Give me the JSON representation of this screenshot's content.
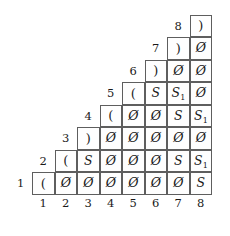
{
  "figure": {
    "kind": "cyk-parse-table",
    "rows": 8,
    "columns": 8,
    "border_color": "#5e5e5e",
    "text_color": "#1a1a1a",
    "background_color": "#ffffff"
  },
  "axes": {
    "row_labels": [
      "1",
      "2",
      "3",
      "4",
      "5",
      "6",
      "7",
      "8"
    ],
    "column_labels": [
      "1",
      "2",
      "3",
      "4",
      "5",
      "6",
      "7",
      "8"
    ]
  },
  "chart_data": {
    "type": "table",
    "title": "",
    "xlabel": "",
    "ylabel": "",
    "shape": "lower-left-staircase triangular",
    "row_labels": [
      "1",
      "2",
      "3",
      "4",
      "5",
      "6",
      "7",
      "8"
    ],
    "column_labels": [
      "1",
      "2",
      "3",
      "4",
      "5",
      "6",
      "7",
      "8"
    ],
    "note": "Row i occupies columns i through 8. Entries are terminals ( and ), the empty-set symbol, or nonterminals S and S1.",
    "rows": [
      {
        "row": 1,
        "start_column": 1,
        "cells": [
          "(",
          "Ø",
          "Ø",
          "Ø",
          "Ø",
          "Ø",
          "Ø",
          "S"
        ]
      },
      {
        "row": 2,
        "start_column": 2,
        "cells": [
          "(",
          "S",
          "Ø",
          "Ø",
          "Ø",
          "S",
          "S₁"
        ]
      },
      {
        "row": 3,
        "start_column": 3,
        "cells": [
          ")",
          "Ø",
          "Ø",
          "Ø",
          "Ø",
          "Ø"
        ]
      },
      {
        "row": 4,
        "start_column": 4,
        "cells": [
          "(",
          "Ø",
          "Ø",
          "S",
          "S₁"
        ]
      },
      {
        "row": 5,
        "start_column": 5,
        "cells": [
          "(",
          "S",
          "S₁",
          "Ø"
        ]
      },
      {
        "row": 6,
        "start_column": 6,
        "cells": [
          ")",
          "Ø",
          "Ø"
        ]
      },
      {
        "row": 7,
        "start_column": 7,
        "cells": [
          ")",
          "Ø"
        ]
      },
      {
        "row": 8,
        "start_column": 8,
        "cells": [
          ")"
        ]
      }
    ]
  }
}
